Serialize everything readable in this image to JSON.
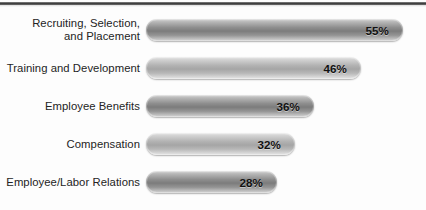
{
  "chart_data": {
    "type": "bar",
    "orientation": "horizontal",
    "title": "",
    "subtitle": "",
    "xlabel": "",
    "ylabel": "",
    "xlim": [
      0,
      60
    ],
    "grid": false,
    "legend": null,
    "value_suffix": "%",
    "categories": [
      "Recruiting, Selection,\nand Placement",
      "Training and Development",
      "Employee Benefits",
      "Compensation",
      "Employee/Labor Relations"
    ],
    "values": [
      55,
      46,
      36,
      32,
      28
    ],
    "value_labels": [
      "55%",
      "46%",
      "36%",
      "32%",
      "28%"
    ],
    "bar_shades": [
      "dark",
      "light",
      "dark",
      "light",
      "dark"
    ],
    "colors": {
      "bar_dark_mid": "#7c7c7c",
      "bar_light_mid": "#a5a5a5",
      "bar_highlight": "#e9e9e9",
      "label_text": "#242424",
      "value_text": "#111111",
      "rule": "#3a3a3a",
      "background": "#fdfdfd"
    }
  },
  "source_note": ""
}
